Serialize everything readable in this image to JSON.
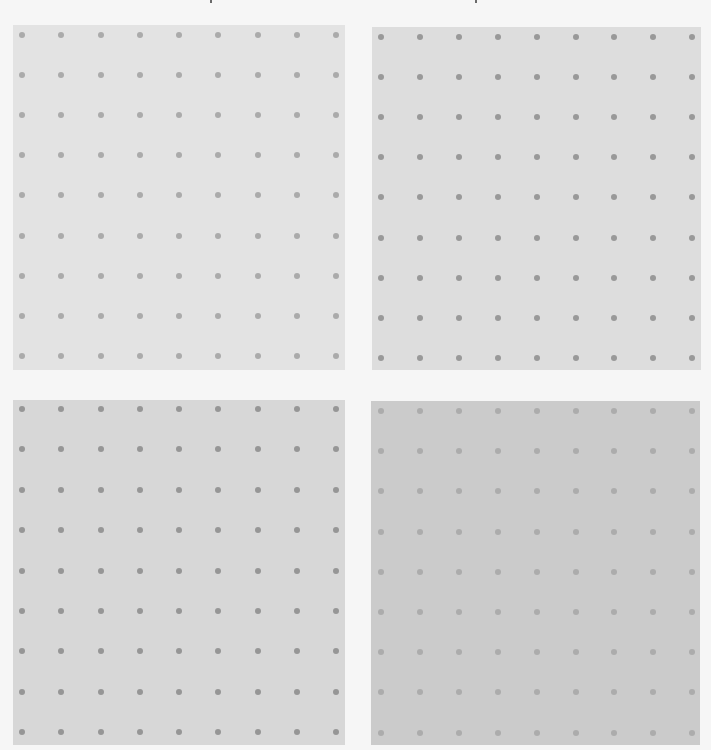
{
  "page": {
    "background": "#f6f6f6",
    "width": 711,
    "height": 750
  },
  "grid": {
    "rows": 9,
    "cols": 9,
    "dot_diameter": 6
  },
  "panels": [
    {
      "id": "top-left",
      "x": 13,
      "y": 25,
      "w": 332,
      "h": 345,
      "background": "#e3e3e3",
      "dot_color": "#ababab",
      "first_dot_x": 22,
      "first_dot_y": 35,
      "spacing_x": 39.25,
      "spacing_y": 40.1
    },
    {
      "id": "top-right",
      "x": 372,
      "y": 27,
      "w": 329,
      "h": 343,
      "background": "#dddddd",
      "dot_color": "#999999",
      "first_dot_x": 381,
      "first_dot_y": 37,
      "spacing_x": 38.9,
      "spacing_y": 40.1
    },
    {
      "id": "bottom-left",
      "x": 13,
      "y": 400,
      "w": 332,
      "h": 345,
      "background": "#d7d7d7",
      "dot_color": "#969696",
      "first_dot_x": 22,
      "first_dot_y": 409,
      "spacing_x": 39.25,
      "spacing_y": 40.4
    },
    {
      "id": "bottom-right",
      "x": 371,
      "y": 401,
      "w": 329,
      "h": 344,
      "background": "#cbcbcb",
      "dot_color": "#acacac",
      "first_dot_x": 381,
      "first_dot_y": 411,
      "spacing_x": 38.9,
      "spacing_y": 40.2
    }
  ],
  "artifacts": [
    {
      "x": 210,
      "y": 0
    },
    {
      "x": 475,
      "y": 0
    }
  ]
}
